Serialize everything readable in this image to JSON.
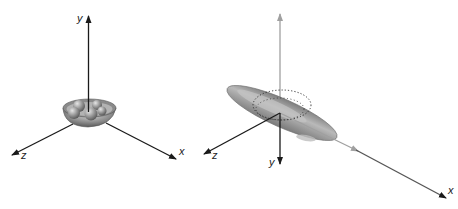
{
  "figure": {
    "left_panel": {
      "axes": {
        "x_label": "x",
        "y_label": "y",
        "z_label": "z"
      },
      "object": "bowl-with-spheres"
    },
    "right_panel": {
      "axes": {
        "x_label": "x",
        "y_label": "y",
        "z_label": "z"
      },
      "object": "tilted-ellipsoid-with-dotted-circle"
    }
  },
  "colors": {
    "axis_dark": "#1a1a1a",
    "axis_light": "#9a9a9a",
    "object_fill": "#8f8f8f",
    "object_highlight": "#c8c8c8",
    "object_shadow": "#5e5e5e",
    "background": "#ffffff"
  }
}
